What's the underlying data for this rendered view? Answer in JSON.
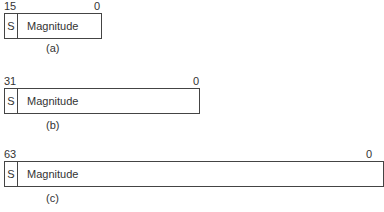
{
  "figures": [
    {
      "id": "a",
      "msb": "15",
      "lsb": "0",
      "sign": "S",
      "field": "Magnitude",
      "caption": "(a)"
    },
    {
      "id": "b",
      "msb": "31",
      "lsb": "0",
      "sign": "S",
      "field": "Magnitude",
      "caption": "(b)"
    },
    {
      "id": "c",
      "msb": "63",
      "lsb": "0",
      "sign": "S",
      "field": "Magnitude",
      "caption": "(c)"
    }
  ]
}
